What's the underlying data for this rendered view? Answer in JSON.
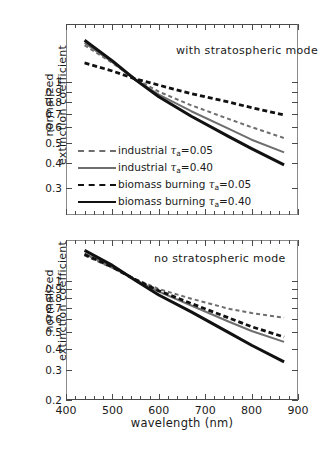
{
  "figure": {
    "x_axis_title": "wavelength (nm)",
    "y_axis_title_line1": "normalized",
    "y_axis_title_line2": "extinction coefficient"
  },
  "panels": [
    {
      "id": "top",
      "note": "with stratospheric mode"
    },
    {
      "id": "bottom",
      "note": "no stratospheric mode"
    }
  ],
  "axes": {
    "x_ticks": [
      "400",
      "500",
      "600",
      "700",
      "800",
      "900"
    ],
    "y_ticks_top": [
      "1",
      "0.9",
      "0.8",
      "0.7",
      "0.6",
      "0.5",
      "0.4",
      "0.3"
    ],
    "y_ticks_bottom": [
      "1",
      "0.9",
      "0.8",
      "0.7",
      "0.6",
      "0.5",
      "0.4",
      "0.3",
      "0.2"
    ]
  },
  "legend": {
    "items": [
      {
        "label_main": "industrial ",
        "tau": "τ",
        "sub": "a",
        "value": "=0.05",
        "style": "gray-dash",
        "color": "#6e6e6e"
      },
      {
        "label_main": "industrial ",
        "tau": "τ",
        "sub": "a",
        "value": "=0.40",
        "style": "gray-solid",
        "color": "#6e6e6e"
      },
      {
        "label_main": "biomass burning ",
        "tau": "τ",
        "sub": "a",
        "value": "=0.05",
        "style": "black-dash",
        "color": "#111111"
      },
      {
        "label_main": "biomass burning ",
        "tau": "τ",
        "sub": "a",
        "value": "=0.40",
        "style": "black-solid",
        "color": "#111111"
      }
    ]
  },
  "chart_data": {
    "type": "line",
    "title": "",
    "xlabel": "wavelength (nm)",
    "ylabel": "normalized extinction coefficient",
    "xlim": [
      400,
      900
    ],
    "x_ticks": [
      400,
      500,
      600,
      700,
      800,
      900
    ],
    "yscale": "log",
    "grid": false,
    "legend_position": "lower-left of top panel",
    "panels": [
      {
        "name": "with stratospheric mode",
        "ylim": [
          0.22,
          1.95
        ],
        "y_ticks": [
          1,
          0.9,
          0.8,
          0.7,
          0.6,
          0.5,
          0.4,
          0.3
        ],
        "x": [
          440,
          500,
          550,
          600,
          670,
          750,
          800,
          870
        ],
        "series": [
          {
            "name": "industrial tau_a=0.05",
            "color": "#6e6e6e",
            "dash": true,
            "values": [
              1.53,
              1.25,
              1.04,
              0.9,
              0.77,
              0.66,
              0.6,
              0.53
            ]
          },
          {
            "name": "industrial tau_a=0.40",
            "color": "#6e6e6e",
            "dash": false,
            "values": [
              1.57,
              1.26,
              1.03,
              0.87,
              0.72,
              0.59,
              0.52,
              0.45
            ]
          },
          {
            "name": "biomass burning tau_a=0.05",
            "color": "#111111",
            "dash": true,
            "values": [
              1.25,
              1.14,
              1.04,
              0.97,
              0.88,
              0.8,
              0.75,
              0.69
            ]
          },
          {
            "name": "biomass burning tau_a=0.40",
            "color": "#111111",
            "dash": false,
            "values": [
              1.62,
              1.28,
              1.03,
              0.85,
              0.68,
              0.54,
              0.47,
              0.39
            ]
          }
        ]
      },
      {
        "name": "no stratospheric mode",
        "ylim": [
          0.2,
          1.75
        ],
        "y_ticks": [
          1,
          0.9,
          0.8,
          0.7,
          0.6,
          0.5,
          0.4,
          0.3,
          0.2
        ],
        "x": [
          440,
          500,
          550,
          600,
          670,
          750,
          800,
          870
        ],
        "series": [
          {
            "name": "industrial tau_a=0.05",
            "color": "#6e6e6e",
            "dash": true,
            "values": [
              1.42,
              1.2,
              1.03,
              0.9,
              0.79,
              0.69,
              0.65,
              0.61
            ]
          },
          {
            "name": "industrial tau_a=0.40",
            "color": "#6e6e6e",
            "dash": false,
            "values": [
              1.45,
              1.21,
              1.02,
              0.87,
              0.72,
              0.58,
              0.51,
              0.44
            ]
          },
          {
            "name": "biomass burning tau_a=0.05",
            "color": "#111111",
            "dash": true,
            "values": [
              1.44,
              1.21,
              1.02,
              0.88,
              0.74,
              0.61,
              0.54,
              0.47
            ]
          },
          {
            "name": "biomass burning tau_a=0.40",
            "color": "#111111",
            "dash": false,
            "values": [
              1.52,
              1.24,
              1.01,
              0.83,
              0.66,
              0.5,
              0.42,
              0.335
            ]
          }
        ]
      }
    ]
  }
}
